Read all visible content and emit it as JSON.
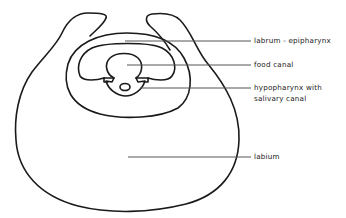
{
  "diagram": {
    "labels": [
      {
        "id": "labrum",
        "text": "labrum - epipharynx"
      },
      {
        "id": "food-canal",
        "text": "food canal"
      },
      {
        "id": "hypopharynx-line1",
        "text": "hypopharynx with"
      },
      {
        "id": "hypopharynx-line2",
        "text": "salivary canal"
      },
      {
        "id": "labium",
        "text": "labium"
      }
    ],
    "colors": {
      "stroke": "#1a1a1a",
      "leader": "#555555",
      "background": "#ffffff"
    }
  }
}
